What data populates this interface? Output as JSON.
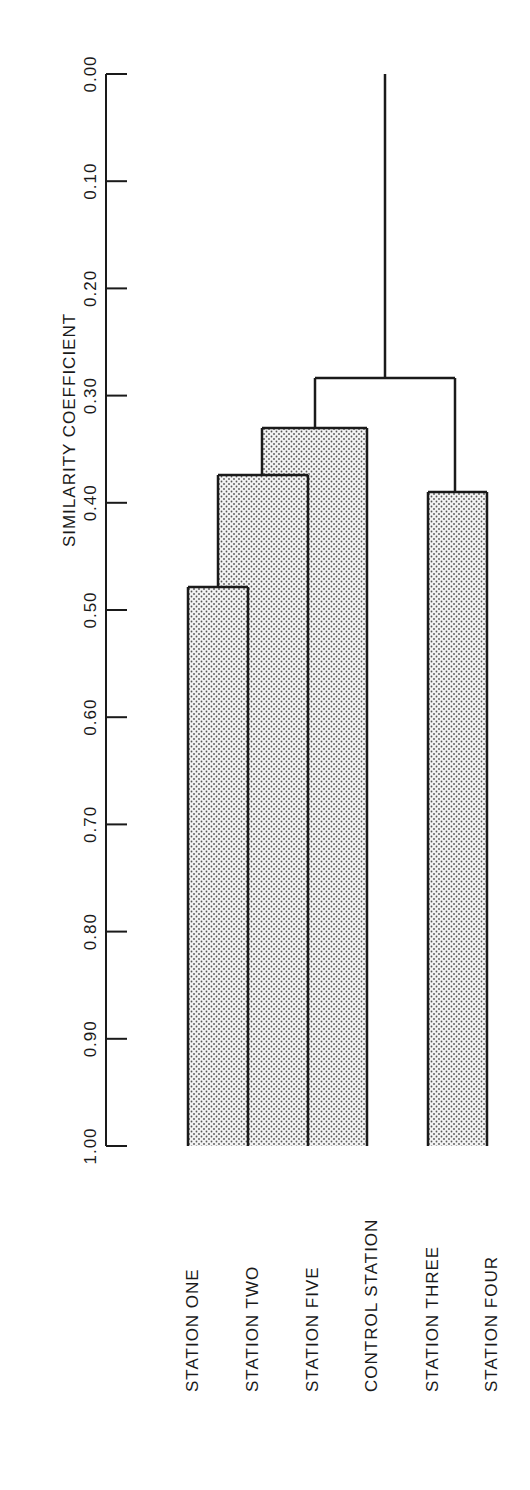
{
  "chart_data": {
    "type": "dendrogram",
    "title": "",
    "ylabel": "SIMILARITY COEFFICIENT",
    "xlabel": "",
    "orientation": "rotated 90° (axis vertical, labels rotated)",
    "yticks": [
      "0.00",
      "0.10",
      "0.20",
      "0.30",
      "0.40",
      "0.50",
      "0.60",
      "0.70",
      "0.80",
      "0.90",
      "1.00"
    ],
    "ylim": [
      0.0,
      1.0
    ],
    "leaves": [
      "STATION ONE",
      "STATION TWO",
      "STATION FIVE",
      "CONTROL STATION",
      "STATION THREE",
      "STATION FOUR"
    ],
    "merges": [
      {
        "members": [
          "STATION ONE",
          "STATION TWO"
        ],
        "similarity": 0.48
      },
      {
        "members": [
          "STATION ONE",
          "STATION TWO",
          "STATION FIVE"
        ],
        "similarity": 0.37
      },
      {
        "members": [
          "STATION ONE",
          "STATION TWO",
          "STATION FIVE",
          "CONTROL STATION"
        ],
        "similarity": 0.33
      },
      {
        "members": [
          "STATION THREE",
          "STATION FOUR"
        ],
        "similarity": 0.39
      },
      {
        "members": [
          "ALL"
        ],
        "similarity": 0.28
      }
    ],
    "note": "Merge similarities are estimated from the axis scale (0.00 at y≈74, 1.00 at y≈1146), not read from printed labels.",
    "grid": false,
    "fill": "stippled gray"
  },
  "axis": {
    "label": "SIMILARITY COEFFICIENT"
  }
}
